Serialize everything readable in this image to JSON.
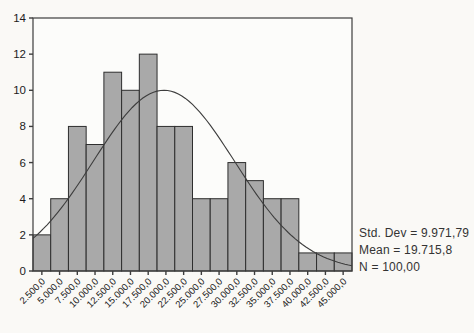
{
  "figure": {
    "background": "#faf9f6",
    "plot_background": "#fcfcfa"
  },
  "chart_data": {
    "type": "bar",
    "subtype": "histogram",
    "title": "",
    "xlabel": "",
    "ylabel": "",
    "categories": [
      "2.500,0",
      "5.000,0",
      "7.500,0",
      "10.000,0",
      "12.500,0",
      "15.000,0",
      "17.500,0",
      "20.000,0",
      "22.500,0",
      "25.000,0",
      "27.500,0",
      "30.000,0",
      "32.500,0",
      "35.000,0",
      "37.500,0",
      "40.000,0",
      "42.500,0",
      "45.000,0"
    ],
    "values": [
      2,
      4,
      8,
      7,
      11,
      10,
      12,
      8,
      8,
      4,
      4,
      6,
      5,
      4,
      4,
      1,
      1,
      1
    ],
    "ylim": [
      0,
      14
    ],
    "yticks": [
      "0",
      "2",
      "4",
      "6",
      "8",
      "10",
      "12",
      "14"
    ],
    "ytick_values": [
      0,
      2,
      4,
      6,
      8,
      10,
      12,
      14
    ],
    "grid": "off",
    "legend": "none",
    "normal_curve": {
      "mean": 19715.8,
      "std_dev": 9971.79,
      "n": 100,
      "bin_width": 2500
    },
    "annotations": [
      "Std. Dev = 9.971,79",
      "Mean = 19.715,8",
      "N = 100,00"
    ]
  },
  "stats_panel": {
    "std_dev_label": "Std. Dev = 9.971,79",
    "mean_label": "Mean = 19.715,8",
    "n_label": "N = 100,00"
  },
  "colors": {
    "bar_fill": "#a9a9a9",
    "bar_stroke": "#2e2e2e",
    "curve": "#3d3d3d",
    "axis": "#3d3d3d",
    "tick_text": "#1c1c1c"
  }
}
